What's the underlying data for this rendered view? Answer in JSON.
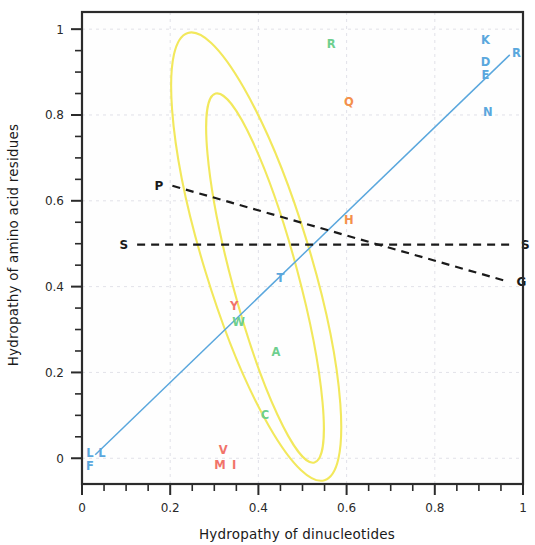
{
  "chart_data": {
    "type": "scatter",
    "title": "",
    "xlabel": "Hydropathy of dinucleotides",
    "ylabel": "Hydropathy of amino acid residues",
    "xlim": [
      0,
      1
    ],
    "ylim": [
      -0.06,
      1.04
    ],
    "xticks": [
      0,
      0.2,
      0.4,
      0.6,
      0.8,
      1
    ],
    "xtick_labels": [
      "0",
      "0.2",
      "0.4",
      "0.6",
      "0.8",
      "1"
    ],
    "yticks": [
      0,
      0.2,
      0.4,
      0.6,
      0.8,
      1
    ],
    "ytick_labels": [
      "0",
      "0.2",
      "0.4",
      "0.6",
      "0.8",
      "1"
    ],
    "x_minor_step": 0.05,
    "y_minor_step": 0.05,
    "grid": true,
    "legend": "none",
    "colors": {
      "blue": "#5aa7dd",
      "green": "#6ecf8e",
      "red": "#f1736a",
      "orange": "#f4904a",
      "yellow": "#f2e85c",
      "black": "#1a1a1a",
      "frame": "#2b2b2b",
      "grid": "#d9d9e2"
    },
    "points": [
      {
        "label": "R",
        "x": 0.565,
        "y": 0.965,
        "color": "green"
      },
      {
        "label": "Q",
        "x": 0.605,
        "y": 0.83,
        "color": "orange"
      },
      {
        "label": "H",
        "x": 0.605,
        "y": 0.555,
        "color": "orange"
      },
      {
        "label": "T",
        "x": 0.45,
        "y": 0.42,
        "color": "blue"
      },
      {
        "label": "Y",
        "x": 0.345,
        "y": 0.355,
        "color": "red"
      },
      {
        "label": "W",
        "x": 0.355,
        "y": 0.318,
        "color": "green"
      },
      {
        "label": "A",
        "x": 0.44,
        "y": 0.247,
        "color": "green"
      },
      {
        "label": "C",
        "x": 0.415,
        "y": 0.1,
        "color": "green"
      },
      {
        "label": "V",
        "x": 0.32,
        "y": 0.02,
        "color": "red"
      },
      {
        "label": "M",
        "x": 0.313,
        "y": -0.015,
        "color": "red"
      },
      {
        "label": "I",
        "x": 0.345,
        "y": -0.015,
        "color": "red"
      },
      {
        "label": "L",
        "x": 0.018,
        "y": 0.013,
        "color": "blue"
      },
      {
        "label": "L",
        "x": 0.045,
        "y": 0.013,
        "color": "blue"
      },
      {
        "label": "F",
        "x": 0.018,
        "y": -0.018,
        "color": "blue"
      },
      {
        "label": "K",
        "x": 0.915,
        "y": 0.975,
        "color": "blue"
      },
      {
        "label": "D",
        "x": 0.915,
        "y": 0.923,
        "color": "blue"
      },
      {
        "label": "E",
        "x": 0.915,
        "y": 0.893,
        "color": "blue"
      },
      {
        "label": "N",
        "x": 0.92,
        "y": 0.808,
        "color": "blue"
      },
      {
        "label": "R",
        "x": 0.985,
        "y": 0.945,
        "color": "blue"
      }
    ],
    "lines": [
      {
        "name": "regression-line",
        "style": "solid",
        "color": "blue",
        "x1": 0.03,
        "y1": 0.008,
        "x2": 0.97,
        "y2": 0.94,
        "label_start": "",
        "label_end": ""
      },
      {
        "name": "s-baseline",
        "style": "dashed",
        "color": "black",
        "x1": 0.125,
        "y1": 0.498,
        "x2": 0.975,
        "y2": 0.498,
        "label_start": "S",
        "label_end": "S"
      },
      {
        "name": "p-to-g-line",
        "style": "dashed",
        "color": "black",
        "x1": 0.205,
        "y1": 0.635,
        "x2": 0.965,
        "y2": 0.412,
        "label_start": "P",
        "label_end": "G"
      }
    ],
    "ellipses": [
      {
        "name": "outer-ellipse",
        "cx": 0.395,
        "cy": 0.47,
        "rx": 0.12,
        "ry": 0.545,
        "rotation": -17,
        "color": "yellow"
      },
      {
        "name": "inner-ellipse",
        "cx": 0.415,
        "cy": 0.42,
        "rx": 0.075,
        "ry": 0.445,
        "rotation": -15,
        "color": "yellow"
      }
    ]
  }
}
